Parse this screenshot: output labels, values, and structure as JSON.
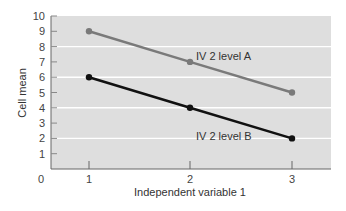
{
  "chart_data": {
    "type": "line",
    "title": "",
    "xlabel": "Independent variable 1",
    "ylabel": "Cell mean",
    "x": [
      1,
      2,
      3
    ],
    "x_tick_labels": [
      "1",
      "2",
      "3"
    ],
    "y_tick_labels": [
      "0",
      "1",
      "2",
      "3",
      "4",
      "5",
      "6",
      "7",
      "8",
      "9",
      "10"
    ],
    "ylim": [
      0,
      10
    ],
    "grid": {
      "y": true,
      "values": [
        2,
        4,
        6,
        8
      ],
      "color": "#ffffff"
    },
    "legend": "inline labels",
    "series": [
      {
        "name": "IV 2 level A",
        "values": [
          9,
          7,
          5
        ],
        "color": "#7a7a7a"
      },
      {
        "name": "IV 2 level B",
        "values": [
          6,
          4,
          2
        ],
        "color": "#111111"
      }
    ],
    "plot_background": "#dedede"
  }
}
